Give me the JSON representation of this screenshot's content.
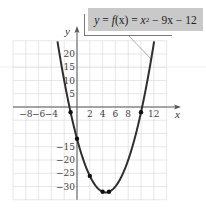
{
  "chart_data": {
    "type": "line",
    "function": "x^2 - 9x - 12",
    "xlabel": "x",
    "ylabel": "y",
    "xlim": [
      -10,
      14
    ],
    "ylim": [
      -35,
      25
    ],
    "grid": true,
    "x_ticks": [
      -8,
      -6,
      -4,
      2,
      4,
      6,
      8,
      12
    ],
    "x_tick_labels": [
      "−8",
      "−6",
      "−4",
      "2",
      "4",
      "6",
      "8",
      "12"
    ],
    "y_ticks": [
      20,
      15,
      10,
      5,
      -15,
      -20,
      -25,
      -30
    ],
    "y_tick_labels": [
      "20",
      "15",
      "10",
      "5",
      "−15",
      "−20",
      "−25",
      "−30"
    ],
    "series": [
      {
        "name": "f(x) = x² − 9x − 12",
        "x": [
          -2,
          -1,
          0,
          1,
          2,
          3,
          4,
          4.5,
          5,
          6,
          7,
          8,
          9,
          10,
          11
        ],
        "values": [
          10,
          -2,
          -12,
          -20,
          -26,
          -30,
          -32,
          -32.25,
          -32,
          -30,
          -26,
          -20,
          -12,
          -2,
          10
        ]
      }
    ],
    "marked_points": [
      {
        "x": -1,
        "y": -2
      },
      {
        "x": 0,
        "y": -12
      },
      {
        "x": 2,
        "y": -26
      },
      {
        "x": 4,
        "y": -32
      },
      {
        "x": 5,
        "y": -32
      },
      {
        "x": 10,
        "y": -2
      }
    ],
    "annotation": "y = f(x) = x² − 9x − 12"
  },
  "labels": {
    "formula_y": "y",
    "formula_eq1": " = ",
    "formula_f": "f",
    "formula_x": "(x)",
    "formula_eq2": " = ",
    "formula_x2": "x",
    "formula_sup": "2",
    "formula_rest": " − 9x − 12",
    "x_axis": "x",
    "y_axis": "y"
  }
}
